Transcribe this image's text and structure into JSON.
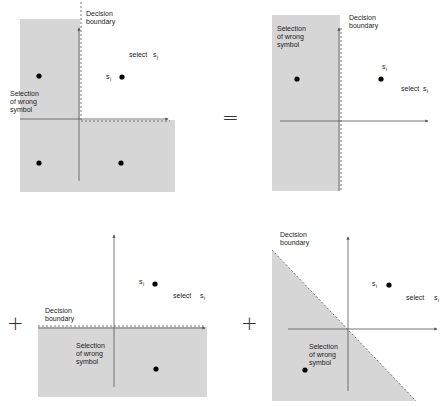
{
  "diagram": {
    "type": "decision-region-decomposition",
    "colors": {
      "region_fill": "#d6d6d6",
      "axis": "#555555",
      "boundary": "#555555",
      "dot": "#000000",
      "background": "#ffffff"
    },
    "operators": {
      "equals": "=",
      "plus_1": "+",
      "plus_2": "+"
    },
    "panels": [
      {
        "id": "panel-top-left",
        "boundary_label_1": "Decision",
        "boundary_label_2": "boundary",
        "select_label": "select",
        "select_symbol": "s",
        "select_sub": "j",
        "point_symbol": "s",
        "point_sub": "i",
        "region_label_1": "Selection",
        "region_label_2": "of wrong",
        "region_label_3": "symbol"
      },
      {
        "id": "panel-top-right",
        "boundary_label_1": "Decision",
        "boundary_label_2": "boundary",
        "select_label": "select",
        "select_symbol": "s",
        "select_sub": "i",
        "point_symbol": "s",
        "point_sub": "i",
        "region_label_1": "Selection",
        "region_label_2": "of wrong",
        "region_label_3": "symbol"
      },
      {
        "id": "panel-bottom-left",
        "boundary_label_1": "Decision",
        "boundary_label_2": "boundary",
        "select_label": "select",
        "select_symbol": "s",
        "select_sub": "i",
        "point_symbol": "s",
        "point_sub": "i",
        "region_label_1": "Selection",
        "region_label_2": "of wrong",
        "region_label_3": "symbol"
      },
      {
        "id": "panel-bottom-right",
        "boundary_label_1": "Decision",
        "boundary_label_2": "boundary",
        "select_label": "select",
        "select_symbol": "s",
        "select_sub": "i",
        "point_symbol": "s",
        "point_sub": "i",
        "region_label_1": "Selection",
        "region_label_2": "of wrong",
        "region_label_3": "symbol"
      }
    ]
  }
}
